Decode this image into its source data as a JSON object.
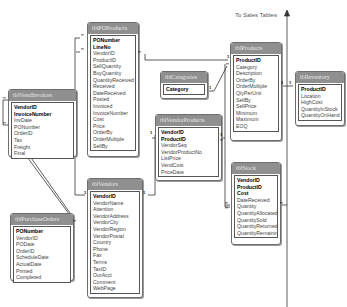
{
  "diagram": {
    "annotation": "To Sales Tables",
    "tables": {
      "tblPOProducts": {
        "title": "tblPOProducts",
        "fields": [
          "PONumber",
          "LineNo",
          "VendorID",
          "ProductID",
          "SellQuantity",
          "BuyQuantity",
          "QuantityReceived",
          "Received",
          "DateReceived",
          "Posted",
          "Invoiced",
          "InvoiceNumber",
          "Cost",
          "Price",
          "OrderBy",
          "OrderMultiple",
          "SellBy"
        ],
        "keys": [
          "PONumber",
          "LineNo"
        ]
      },
      "tblVendInvoices": {
        "title": "tblVendInvoices",
        "fields": [
          "VendorID",
          "InvoiceNumber",
          "InvDate",
          "PONumber",
          "OrderID",
          "Tax",
          "Freight",
          "Final"
        ],
        "keys": [
          "VendorID",
          "InvoiceNumber"
        ]
      },
      "tblPurchaseOrders": {
        "title": "tblPurchaseOrders",
        "fields": [
          "PONumber",
          "VendorID",
          "PODate",
          "OrderID",
          "ScheduleDate",
          "ActualDate",
          "Printed",
          "Completed"
        ],
        "keys": [
          "PONumber"
        ]
      },
      "tblVendors": {
        "title": "tblVendors",
        "fields": [
          "VendorID",
          "VendorName",
          "Attention",
          "VendorAddress",
          "VendorCity",
          "VendorRegion",
          "VendorPostal",
          "Country",
          "Phone",
          "Fax",
          "Terms",
          "TaxID",
          "OurAcct",
          "Comment",
          "WebPage"
        ],
        "keys": [
          "VendorID"
        ]
      },
      "tblCategories": {
        "title": "tblCategories",
        "fields": [
          "Category"
        ],
        "keys": [
          "Category"
        ]
      },
      "tblVendorProducts": {
        "title": "tblVendorProducts",
        "fields": [
          "VendorID",
          "ProductID",
          "VendorSeq",
          "VendorProductNo",
          "ListPrice",
          "VendCost",
          "PriceDate"
        ],
        "keys": [
          "VendorID",
          "ProductID"
        ]
      },
      "tblProducts": {
        "title": "tblProducts",
        "fields": [
          "ProductID",
          "Category",
          "Description",
          "OrderBy",
          "OrderMultiple",
          "QtyPerUnit",
          "SellBy",
          "SellPrice",
          "Minimum",
          "Maximum",
          "EOQ"
        ],
        "keys": [
          "ProductID"
        ]
      },
      "tblInventory": {
        "title": "tblInventory",
        "fields": [
          "ProductID",
          "Location",
          "HighCost",
          "QuantityInStock",
          "QuantityOnHand"
        ],
        "keys": [
          "ProductID"
        ]
      },
      "tblStock": {
        "title": "tblStock",
        "fields": [
          "VendorID",
          "ProductID",
          "Cost",
          "DateReceived",
          "Quantity",
          "QuantityAllocated",
          "QuantitySold",
          "QuantityReturned",
          "QuantityRemaining"
        ],
        "keys": [
          "VendorID",
          "ProductID",
          "Cost"
        ]
      }
    },
    "cardinality": {
      "one": "1",
      "many": "∞"
    }
  }
}
